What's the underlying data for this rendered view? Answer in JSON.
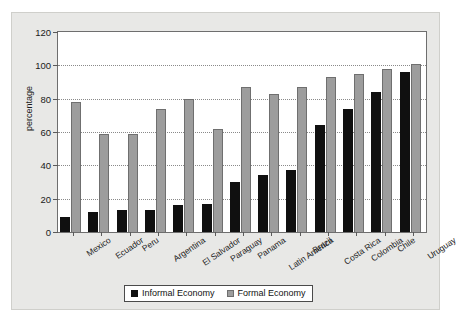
{
  "chart_data": {
    "type": "bar",
    "title": "",
    "xlabel": "",
    "ylabel": "percentage",
    "ylim": [
      0,
      120
    ],
    "yticks": [
      0,
      20,
      40,
      60,
      80,
      100,
      120
    ],
    "grid": true,
    "legend_position": "bottom-center",
    "categories": [
      "Mexico",
      "Ecuador",
      "Peru",
      "Argentina",
      "El Salvador",
      "Paraguay",
      "Panama",
      "Latin America",
      "Brazil",
      "Costa Rica",
      "Colombia",
      "Chile",
      "Uruguay"
    ],
    "series": [
      {
        "name": "Informal Economy",
        "color": "#101010",
        "values": [
          9,
          12,
          13,
          13,
          16,
          17,
          30,
          34,
          37,
          64,
          74,
          84,
          96
        ]
      },
      {
        "name": "Formal Economy",
        "color": "#9d9d9d",
        "values": [
          78,
          59,
          59,
          74,
          80,
          62,
          87,
          83,
          87,
          93,
          95,
          98,
          101
        ]
      }
    ]
  },
  "legend": {
    "entries": [
      {
        "label": "Informal Economy"
      },
      {
        "label": "Formal Economy"
      }
    ]
  },
  "axes": {
    "y_title": "percentage"
  }
}
